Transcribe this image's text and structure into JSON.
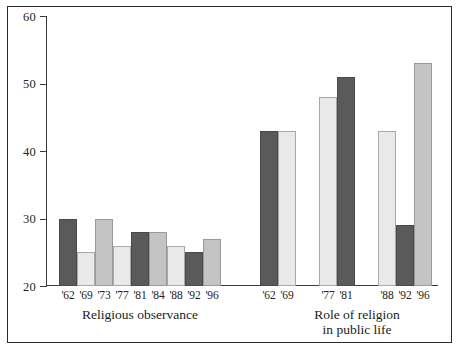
{
  "chart_data": {
    "type": "bar",
    "title": "",
    "subtitle": "",
    "xlabel": "",
    "ylabel": "",
    "ylim": [
      20,
      60
    ],
    "yticks": [
      20,
      30,
      40,
      50,
      60
    ],
    "ytick_labels": [
      "20",
      "30",
      "40",
      "50",
      "60"
    ],
    "grid": false,
    "legend": "none",
    "groups": [
      {
        "name": "Religious observance",
        "caption_lines": [
          "Religious observance"
        ],
        "categories": [
          "'62",
          "'69",
          "'73",
          "'77",
          "'81",
          "'84",
          "'88",
          "'92",
          "'96"
        ],
        "values": [
          30,
          25,
          30,
          26,
          28,
          28,
          26,
          25,
          27
        ],
        "shades": [
          "dark",
          "light",
          "medium",
          "light",
          "dark",
          "medium",
          "light",
          "dark",
          "medium"
        ]
      },
      {
        "name": "Role of religion in public life",
        "caption_lines": [
          "Role of religion",
          "in public life"
        ],
        "categories": [
          "'62",
          "'69",
          "'77",
          "'81",
          "'88",
          "'92",
          "'96"
        ],
        "values": [
          43,
          43,
          48,
          51,
          43,
          29,
          53
        ],
        "shades": [
          "dark",
          "light",
          "light",
          "dark",
          "light",
          "dark",
          "medium"
        ],
        "subclusters": [
          [
            "'62",
            "'69"
          ],
          [
            "'77",
            "'81"
          ],
          [
            "'88",
            "'92",
            "'96"
          ]
        ]
      }
    ],
    "colors": {
      "dark": "#5a5a5a",
      "medium": "#c4c4c4",
      "light": "#e9e9e9",
      "bar_outline": "#8d8d8d",
      "axis": "#3a3a3a",
      "frame": "#2a2a2a",
      "background": "#ffffff",
      "text": "#1b1b1b"
    }
  },
  "axis": {
    "y_ticks": [
      {
        "value": 60,
        "label": "60"
      },
      {
        "value": 50,
        "label": "50"
      },
      {
        "value": 40,
        "label": "40"
      },
      {
        "value": 30,
        "label": "30"
      },
      {
        "value": 20,
        "label": "20"
      }
    ]
  },
  "captions": {
    "left": "Religious observance",
    "right_line1": "Role of religion",
    "right_line2": "in public life"
  }
}
